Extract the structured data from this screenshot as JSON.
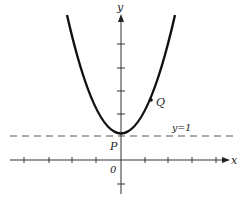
{
  "diagram": {
    "type": "function-graph",
    "function": "y = x^2 + 1",
    "axes": {
      "x_label": "x",
      "y_label": "y",
      "origin_label": "0",
      "x_ticks": [
        -4,
        -3,
        -2,
        -1,
        1,
        2,
        3,
        4
      ],
      "y_ticks": [
        -1,
        1,
        2,
        3,
        4,
        5
      ]
    },
    "points": [
      {
        "name": "P",
        "label": "P",
        "x": 0,
        "y": 1
      },
      {
        "name": "Q",
        "label": "Q",
        "x": 1.3,
        "y": 2.69
      }
    ],
    "asymptote_line": {
      "label": "y=1",
      "y": 1,
      "style": "dashed"
    },
    "x_range": [
      -2.25,
      2.25
    ],
    "colors": {
      "curve": "#111111",
      "axes": "#333333",
      "dashed": "#555555"
    }
  }
}
